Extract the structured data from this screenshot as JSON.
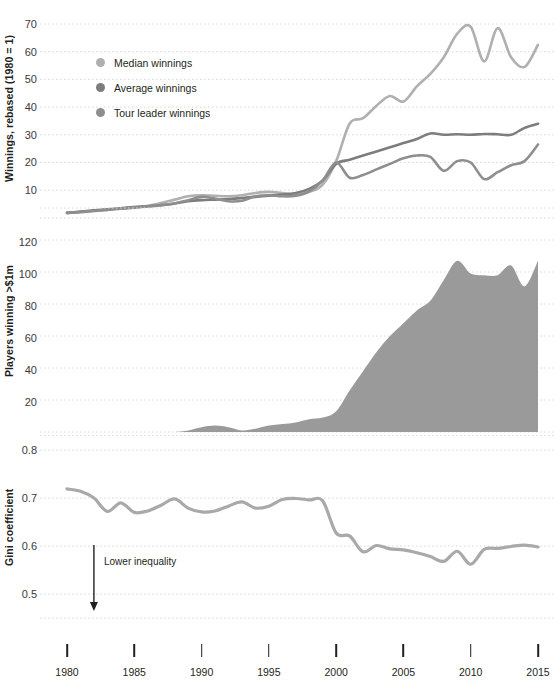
{
  "chart_data": [
    {
      "type": "line",
      "panel": "winnings",
      "title": "",
      "ylabel": "Winnings, rebased (1980 = 1)",
      "xlabel": "",
      "ylim": [
        0,
        75
      ],
      "yticks": [
        10,
        20,
        30,
        40,
        50,
        60,
        70
      ],
      "xlim": [
        1980,
        2015
      ],
      "xticks": [
        1980,
        1985,
        1990,
        1995,
        2000,
        2005,
        2010,
        2015
      ],
      "grid": true,
      "legend_position": "upper-left",
      "x": [
        1980,
        1981,
        1982,
        1983,
        1984,
        1985,
        1986,
        1987,
        1988,
        1989,
        1990,
        1991,
        1992,
        1993,
        1994,
        1995,
        1996,
        1997,
        1998,
        1999,
        2000,
        2001,
        2002,
        2003,
        2004,
        2005,
        2006,
        2007,
        2008,
        2009,
        2010,
        2011,
        2012,
        2013,
        2014,
        2015
      ],
      "series": [
        {
          "name": "Median winnings",
          "color": "#b0b0b0",
          "values": [
            1.8,
            2.2,
            2.6,
            3.0,
            3.4,
            3.8,
            4.4,
            5.4,
            6.6,
            7.8,
            8.2,
            8.0,
            7.8,
            8.2,
            9.0,
            9.4,
            9.0,
            8.6,
            9.4,
            12.0,
            20.5,
            34.0,
            36.0,
            40.5,
            44.0,
            42.0,
            47.5,
            52.0,
            58.0,
            66.5,
            69.0,
            56.5,
            68.5,
            58.0,
            54.5,
            62.5
          ]
        },
        {
          "name": "Average winnings",
          "color": "#7d7d7d",
          "values": [
            1.8,
            2.3,
            2.7,
            3.1,
            3.5,
            3.9,
            4.2,
            4.6,
            5.2,
            6.0,
            6.4,
            6.6,
            6.8,
            7.2,
            7.6,
            8.0,
            8.4,
            9.0,
            10.5,
            13.5,
            19.5,
            21.0,
            22.5,
            24.0,
            25.5,
            27.0,
            28.5,
            30.5,
            30.0,
            30.2,
            30.0,
            30.3,
            30.2,
            30.0,
            32.5,
            34.0
          ]
        },
        {
          "name": "Tour leader winnings",
          "color": "#8e8e8e",
          "values": [
            1.8,
            2.1,
            2.5,
            2.9,
            3.3,
            3.7,
            4.1,
            4.6,
            5.2,
            6.4,
            7.6,
            7.0,
            6.0,
            6.2,
            7.8,
            8.2,
            7.8,
            8.0,
            9.6,
            13.5,
            20.0,
            14.5,
            15.5,
            17.5,
            19.5,
            21.5,
            22.5,
            22.0,
            17.0,
            20.5,
            20.0,
            14.0,
            16.5,
            19.0,
            20.5,
            26.5
          ]
        }
      ]
    },
    {
      "type": "area",
      "panel": "millionaires",
      "title": "",
      "ylabel": "Players winning >$1m",
      "xlabel": "",
      "ylim": [
        0,
        130
      ],
      "yticks": [
        20,
        40,
        60,
        80,
        100,
        120
      ],
      "xlim": [
        1980,
        2015
      ],
      "grid": true,
      "x": [
        1980,
        1981,
        1982,
        1983,
        1984,
        1985,
        1986,
        1987,
        1988,
        1989,
        1990,
        1991,
        1992,
        1993,
        1994,
        1995,
        1996,
        1997,
        1998,
        1999,
        2000,
        2001,
        2002,
        2003,
        2004,
        2005,
        2006,
        2007,
        2008,
        2009,
        2010,
        2011,
        2012,
        2013,
        2014,
        2015
      ],
      "values": [
        0,
        0,
        0,
        0,
        0,
        0,
        0,
        0,
        0,
        1,
        3,
        4,
        3,
        1,
        2,
        4,
        5,
        6,
        8,
        9,
        13,
        26,
        38,
        50,
        60,
        68,
        76,
        82,
        95,
        107,
        99,
        98,
        98,
        104,
        91,
        107
      ],
      "color": "#9a9a9a"
    },
    {
      "type": "line",
      "panel": "gini",
      "title": "",
      "ylabel": "Gini coefficient",
      "xlabel": "",
      "ylim": [
        0.44,
        0.83
      ],
      "yticks": [
        0.5,
        0.6,
        0.7,
        0.8
      ],
      "ytick_labels": [
        "0.5",
        "0.6",
        "0.7",
        "0.8"
      ],
      "xlim": [
        1980,
        2015
      ],
      "grid": true,
      "annotation": "Lower inequality",
      "x": [
        1980,
        1981,
        1982,
        1983,
        1984,
        1985,
        1986,
        1987,
        1988,
        1989,
        1990,
        1991,
        1992,
        1993,
        1994,
        1995,
        1996,
        1997,
        1998,
        1999,
        2000,
        2001,
        2002,
        2003,
        2004,
        2005,
        2006,
        2007,
        2008,
        2009,
        2010,
        2011,
        2012,
        2013,
        2014,
        2015
      ],
      "values": [
        0.719,
        0.714,
        0.7,
        0.672,
        0.69,
        0.67,
        0.673,
        0.685,
        0.698,
        0.679,
        0.671,
        0.673,
        0.683,
        0.692,
        0.679,
        0.683,
        0.697,
        0.699,
        0.696,
        0.694,
        0.627,
        0.621,
        0.588,
        0.601,
        0.594,
        0.592,
        0.586,
        0.578,
        0.568,
        0.589,
        0.562,
        0.593,
        0.595,
        0.599,
        0.602,
        0.598
      ]
    }
  ],
  "panels": {
    "winnings": {
      "ylabel": "Winnings, rebased (1980 = 1)",
      "ytick_labels": [
        "70",
        "60",
        "50",
        "40",
        "30",
        "20",
        "10"
      ],
      "legend": [
        {
          "label": "Median winnings",
          "color": "#b0b0b0",
          "marker": "legend-dot-icon"
        },
        {
          "label": "Average winnings",
          "color": "#7d7d7d",
          "marker": "legend-dot-icon"
        },
        {
          "label": "Tour leader winnings",
          "color": "#8e8e8e",
          "marker": "legend-dot-icon"
        }
      ]
    },
    "millionaires": {
      "ylabel": "Players winning >$1m",
      "ytick_labels": [
        "120",
        "100",
        "80",
        "60",
        "40",
        "20"
      ]
    },
    "gini": {
      "ylabel": "Gini coefficient",
      "ytick_labels": [
        "0.8",
        "0.7",
        "0.6",
        "0.5"
      ],
      "annotation": "Lower inequality"
    }
  },
  "x_axis": {
    "tick_labels": [
      "1980",
      "1985",
      "1990",
      "1995",
      "2000",
      "2005",
      "2010",
      "2015"
    ]
  },
  "colors": {
    "median": "#b0b0b0",
    "average": "#7d7d7d",
    "tour_leader": "#8e8e8e",
    "area_fill": "#9a9a9a",
    "gini_line": "#a9a9a9",
    "grid": "#d8d8d8",
    "text": "#231f20"
  }
}
